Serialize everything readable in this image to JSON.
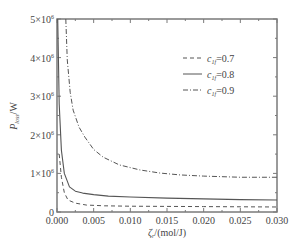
{
  "chart_data": {
    "type": "line",
    "title": "",
    "xlabel": "ζ_r/(mol/J)",
    "xlabel_parts": {
      "symbol": "ζ",
      "sub": "r",
      "unit": "/(mol/J)"
    },
    "ylabel": "P_loss/W",
    "ylabel_parts": {
      "symbol": "P",
      "sub": "loss",
      "unit": "/W"
    },
    "xlim": [
      0,
      0.03
    ],
    "ylim": [
      0,
      5000000
    ],
    "xticks": [
      0,
      0.005,
      0.01,
      0.015,
      0.02,
      0.025,
      0.03
    ],
    "xtick_labels": [
      "0.000",
      "0.005",
      "0.010",
      "0.015",
      "0.020",
      "0.025",
      "0.030"
    ],
    "yticks": [
      0,
      1000000,
      2000000,
      3000000,
      4000000,
      5000000
    ],
    "ytick_labels": [
      "0",
      "1×10",
      "2×10",
      "3×10",
      "4×10",
      "5×10"
    ],
    "ytick_exponent": "6",
    "grid": false,
    "legend_position": "upper right",
    "series": [
      {
        "name": "c_1f=0.7",
        "label_parts": {
          "symbol": "c",
          "sub": "1f",
          "value": "=0.7"
        },
        "style": "dashed",
        "x": [
          0.0003,
          0.0006,
          0.001,
          0.0015,
          0.0025,
          0.004,
          0.0065,
          0.01,
          0.015,
          0.02,
          0.025,
          0.03
        ],
        "y": [
          1500000,
          900000,
          500000,
          310000,
          230000,
          180000,
          160000,
          150000,
          145000,
          140000,
          135000,
          130000
        ]
      },
      {
        "name": "c_1f=0.8",
        "label_parts": {
          "symbol": "c",
          "sub": "1f",
          "value": "=0.8"
        },
        "style": "solid",
        "x": [
          0.0001,
          0.0003,
          0.0006,
          0.001,
          0.0017,
          0.0025,
          0.0035,
          0.005,
          0.007,
          0.01,
          0.015,
          0.02,
          0.025,
          0.03
        ],
        "y": [
          5000000,
          2800000,
          1600000,
          1000000,
          650000,
          540000,
          490000,
          450000,
          410000,
          390000,
          360000,
          340000,
          320000,
          310000
        ]
      },
      {
        "name": "c_1f=0.9",
        "label_parts": {
          "symbol": "c",
          "sub": "1f",
          "value": "=0.9"
        },
        "style": "dashdot",
        "x": [
          0.0012,
          0.0014,
          0.0018,
          0.0022,
          0.003,
          0.0038,
          0.005,
          0.0063,
          0.0085,
          0.0113,
          0.014,
          0.0168,
          0.02,
          0.025,
          0.03
        ],
        "y": [
          5000000,
          3940000,
          3100000,
          2640000,
          2200000,
          1940000,
          1620000,
          1420000,
          1220000,
          1090000,
          1010000,
          960000,
          930000,
          900000,
          900000
        ]
      }
    ]
  },
  "layout": {
    "plot_left": 57,
    "plot_right": 277,
    "plot_top": 19,
    "plot_bottom": 212,
    "colors": {
      "axis": "#7a7a7a",
      "series": "#555555",
      "text": "#444444"
    }
  }
}
